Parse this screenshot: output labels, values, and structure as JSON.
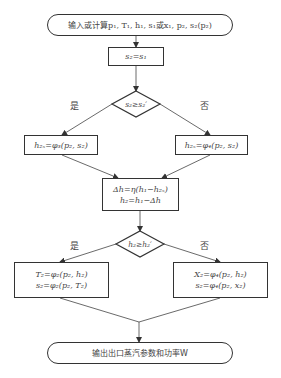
{
  "diagram": {
    "type": "flowchart",
    "nodes": {
      "start": {
        "shape": "terminal",
        "text": "输入或计算p₁, T₁, h₁, s₁或x₁, p₂, s₂(p₂)"
      },
      "assign_s2": {
        "shape": "process",
        "text": "s₂=s₁"
      },
      "decision1": {
        "shape": "diamond",
        "text": "s₂≥s₂′"
      },
      "left1": {
        "shape": "process",
        "text": "h₂ₛ=φ₃(p₂, s₂)"
      },
      "right1": {
        "shape": "process",
        "text": "h₂ₛ=φ₄(p₂, s₂)"
      },
      "delta_h": {
        "shape": "process",
        "line1": "Δh=η(h₁−h₂ₛ)",
        "line2": "h₂=h₁−Δh"
      },
      "decision2": {
        "shape": "diamond",
        "text": "h₂≥h₂′"
      },
      "left2": {
        "shape": "process",
        "line1": "T₂=φ₂(p₂, h₂)",
        "line2": "s₂=φ₂(p₂, T₂)"
      },
      "right2": {
        "shape": "process",
        "line1": "X₂=φ₄(p₂, h₂)",
        "line2": "s₂=φ₄(p₂, x₂)"
      },
      "end": {
        "shape": "terminal",
        "text": "输出出口蒸汽参数和功率W"
      }
    },
    "branch_labels": {
      "yes1": "是",
      "no1": "否",
      "yes2": "是",
      "no2": "否"
    },
    "edges": [
      [
        "start",
        "assign_s2"
      ],
      [
        "assign_s2",
        "decision1"
      ],
      [
        "decision1",
        "left1",
        "是"
      ],
      [
        "decision1",
        "right1",
        "否"
      ],
      [
        "left1",
        "delta_h"
      ],
      [
        "right1",
        "delta_h"
      ],
      [
        "delta_h",
        "decision2"
      ],
      [
        "decision2",
        "left2",
        "是"
      ],
      [
        "decision2",
        "right2",
        "否"
      ],
      [
        "left2",
        "end"
      ],
      [
        "right2",
        "end"
      ]
    ],
    "colors": {
      "stroke": "#333333",
      "text": "#444444",
      "background": "#ffffff"
    }
  }
}
